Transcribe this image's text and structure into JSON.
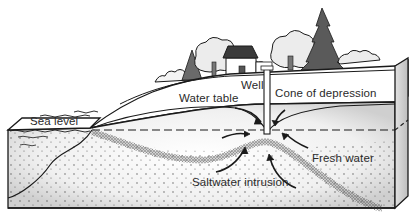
{
  "diagram": {
    "labels": {
      "well": "Well",
      "water_table": "Water table",
      "cone_of_depression": "Cone of depression",
      "sea_level": "Sea level",
      "fresh_water": "Fresh water",
      "saltwater_intrusion": "Saltwater intrusion"
    },
    "elements": [
      "house",
      "trees",
      "well",
      "water-table",
      "cone-of-depression",
      "sea",
      "sea-level-line",
      "fresh-water-zone",
      "saltwater-wedge",
      "flow-arrows"
    ],
    "colors": {
      "outline": "#1a1a1a",
      "shading": "#d4d4d4",
      "tree_dark": "#5a5a5a",
      "background": "#ffffff"
    }
  }
}
